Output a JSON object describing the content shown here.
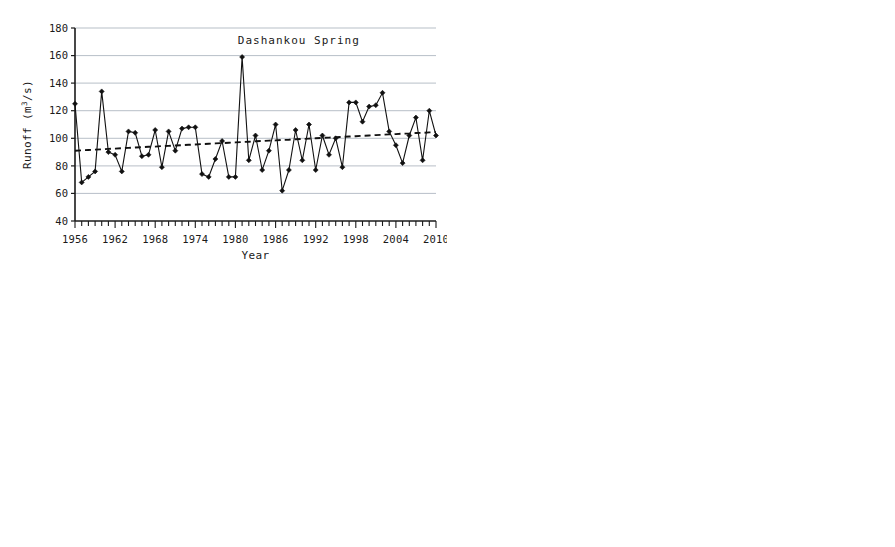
{
  "figure": {
    "station": "Dashankou",
    "x_axis_label": "Year",
    "y_axis_label_main": "Runoff",
    "y_axis_label_units": "(m/s)",
    "y_axis_units_superscript": "3"
  },
  "chart_data": [
    {
      "type": "line",
      "title": "Dashankou    Spring",
      "station": "Dashankou",
      "season": "Spring",
      "xlabel": "Year",
      "ylabel": "Runoff (m3/s)",
      "xlim": [
        1956,
        2010
      ],
      "ylim": [
        40,
        180
      ],
      "ytick_values": [
        40,
        60,
        80,
        100,
        120,
        140,
        160,
        180
      ],
      "xtick_labels": [
        1956,
        1962,
        1968,
        1974,
        1980,
        1986,
        1992,
        1998,
        2004,
        2010
      ],
      "grid": true,
      "legend": "none",
      "x": [
        1956,
        1957,
        1958,
        1959,
        1960,
        1961,
        1962,
        1963,
        1964,
        1965,
        1966,
        1967,
        1968,
        1969,
        1970,
        1971,
        1972,
        1973,
        1974,
        1975,
        1976,
        1977,
        1978,
        1979,
        1980,
        1981,
        1982,
        1983,
        1984,
        1985,
        1986,
        1987,
        1988,
        1989,
        1990,
        1991,
        1992,
        1993,
        1994,
        1995,
        1996,
        1997,
        1998,
        1999,
        2000,
        2001,
        2002,
        2003,
        2004,
        2005,
        2006,
        2007,
        2008,
        2009,
        2010
      ],
      "series": [
        {
          "name": "Spring runoff",
          "marker": "diamond",
          "style": "solid",
          "values": [
            125,
            68,
            72,
            76,
            134,
            90,
            88,
            76,
            105,
            104,
            87,
            88,
            106,
            79,
            105,
            91,
            107,
            108,
            108,
            74,
            72,
            85,
            98,
            72,
            72,
            159,
            84,
            102,
            77,
            91,
            110,
            62,
            77,
            106,
            84,
            110,
            77,
            102,
            88,
            100,
            79,
            126,
            126,
            112,
            123,
            124,
            133,
            105,
            95,
            82,
            102,
            115,
            84,
            120,
            102
          ]
        },
        {
          "name": "Trend line",
          "marker": "none",
          "style": "dashed",
          "values": [
            91,
            91.3,
            91.5,
            91.8,
            92,
            92.3,
            92.5,
            92.8,
            93,
            93.3,
            93.5,
            93.8,
            94,
            94.3,
            94.5,
            94.8,
            95,
            95.3,
            95.5,
            95.8,
            96,
            96.3,
            96.5,
            96.8,
            97,
            97.3,
            97.5,
            97.8,
            98,
            98.3,
            98.5,
            98.8,
            99,
            99.3,
            99.5,
            99.8,
            100,
            100.3,
            100.5,
            100.8,
            101,
            101.3,
            101.5,
            101.8,
            102,
            102.3,
            102.5,
            102.8,
            103,
            103.3,
            103.5,
            103.8,
            104,
            104.3,
            104.5
          ]
        }
      ]
    },
    {
      "type": "line",
      "title": "Dashankou    Summer",
      "station": "Dashankou",
      "season": "Summer",
      "xlabel": "Year",
      "ylabel": "Runoff (m3/s)",
      "xlim": [
        1956,
        2010
      ],
      "ylim": [
        40,
        440
      ],
      "ytick_values": [
        40,
        90,
        140,
        190,
        240,
        290,
        340,
        390,
        440
      ],
      "xtick_labels": [
        1956,
        1962,
        1968,
        1974,
        1980,
        1986,
        1992,
        1998,
        2004,
        2010
      ],
      "grid": true,
      "legend": "none",
      "x": [
        1956,
        1957,
        1958,
        1959,
        1960,
        1961,
        1962,
        1963,
        1964,
        1965,
        1966,
        1967,
        1968,
        1969,
        1970,
        1971,
        1972,
        1973,
        1974,
        1975,
        1976,
        1977,
        1978,
        1979,
        1980,
        1981,
        1982,
        1983,
        1984,
        1985,
        1986,
        1987,
        1988,
        1989,
        1990,
        1991,
        1992,
        1993,
        1994,
        1995,
        1996,
        1997,
        1998,
        1999,
        2000,
        2001,
        2002,
        2003,
        2004,
        2005,
        2006,
        2007,
        2008,
        2009,
        2010
      ],
      "series": [
        {
          "name": "Summer runoff",
          "marker": "diamond",
          "style": "solid",
          "values": [
            234,
            180,
            301,
            255,
            192,
            165,
            166,
            215,
            219,
            185,
            187,
            125,
            228,
            238,
            256,
            194,
            191,
            115,
            196,
            138,
            196,
            172,
            186,
            187,
            152,
            163,
            178,
            149,
            147,
            147,
            139,
            232,
            166,
            165,
            145,
            190,
            203,
            205,
            181,
            241,
            140,
            205,
            231,
            310,
            305,
            225,
            208,
            385,
            207,
            182,
            178,
            180,
            215,
            213,
            194,
            283
          ]
        },
        {
          "name": "Trend line",
          "marker": "none",
          "style": "dashed",
          "values": [
            188,
            188.6,
            189.1,
            189.7,
            190.3,
            190.9,
            191.4,
            192,
            192.6,
            193.1,
            193.7,
            194.3,
            194.9,
            195.4,
            196,
            196.6,
            197.1,
            197.7,
            198.3,
            198.9,
            199.4,
            200,
            200.6,
            201.1,
            201.7,
            202.3,
            202.9,
            203.4,
            204,
            204.6,
            205.1,
            205.7,
            206.3,
            206.9,
            207.4,
            208,
            208.6,
            209.1,
            209.7,
            210.3,
            210.9,
            211.4,
            212,
            212.6,
            213.1,
            213.7,
            214.3,
            214.9,
            215.4,
            216,
            216.6,
            217.1,
            217.7,
            218.3,
            218.9
          ]
        }
      ]
    },
    {
      "type": "line",
      "title": "Dashankou    Autumn",
      "station": "Dashankou",
      "season": "Autumn",
      "xlabel": "Year",
      "ylabel": "Runoff (m3/s)",
      "xlim": [
        1956,
        2010
      ],
      "ylim": [
        40,
        340
      ],
      "ytick_values": [
        40,
        90,
        140,
        190,
        240,
        290,
        340
      ],
      "xtick_labels": [
        1956,
        1962,
        1968,
        1974,
        1980,
        1986,
        1992,
        1998,
        2004,
        2010
      ],
      "grid": true,
      "legend": "none",
      "x": [
        1956,
        1957,
        1958,
        1959,
        1960,
        1961,
        1962,
        1963,
        1964,
        1965,
        1966,
        1967,
        1968,
        1969,
        1970,
        1971,
        1972,
        1973,
        1974,
        1975,
        1976,
        1977,
        1978,
        1979,
        1980,
        1981,
        1982,
        1983,
        1984,
        1985,
        1986,
        1987,
        1988,
        1989,
        1990,
        1991,
        1992,
        1993,
        1994,
        1995,
        1996,
        1997,
        1998,
        1999,
        2000,
        2001,
        2002,
        2003,
        2004,
        2005,
        2006,
        2007,
        2008,
        2009,
        2010
      ],
      "series": [
        {
          "name": "Autumn runoff",
          "marker": "diamond",
          "style": "solid",
          "values": [
            94,
            83,
            137,
            108,
            97,
            92,
            91,
            95,
            102,
            104,
            95,
            98,
            96,
            82,
            94,
            157,
            112,
            97,
            85,
            81,
            80,
            83,
            83,
            82,
            90,
            74,
            67,
            65,
            65,
            66,
            69,
            80,
            131,
            75,
            86,
            78,
            93,
            97,
            113,
            92,
            101,
            106,
            118,
            125,
            122,
            136,
            126,
            83,
            81,
            128,
            277,
            114,
            117,
            105,
            270
          ]
        },
        {
          "name": "Trend line",
          "marker": "none",
          "style": "dashed",
          "values": [
            83,
            83.7,
            84.4,
            85.1,
            85.8,
            86.5,
            87.2,
            87.9,
            88.6,
            89.3,
            90,
            90.7,
            91.4,
            92.1,
            92.8,
            93.5,
            94.2,
            94.9,
            95.6,
            96.3,
            97,
            97.7,
            98.4,
            99.1,
            99.8,
            100.5,
            101.2,
            101.9,
            102.6,
            103.3,
            104,
            104.7,
            105.4,
            106.1,
            106.8,
            107.5,
            108.2,
            108.9,
            109.6,
            110.3,
            111,
            111.7,
            112.4,
            113.1,
            113.8,
            114.5,
            115.2,
            115.9,
            116.6,
            117.3,
            118,
            118.7,
            119.4,
            120.1,
            120.8
          ]
        }
      ]
    },
    {
      "type": "line",
      "title": "Dashankou    Winter",
      "station": "Dashankou",
      "season": "Winter",
      "xlabel": "Year",
      "ylabel": "Runoff (m3/s)",
      "xlim": [
        1956,
        2010
      ],
      "ylim": [
        0,
        180
      ],
      "ytick_values": [
        0,
        20,
        40,
        60,
        80,
        100,
        120,
        140,
        160,
        180
      ],
      "xtick_labels": [
        1956,
        1962,
        1968,
        1974,
        1980,
        1986,
        1992,
        1998,
        2004,
        2010
      ],
      "grid": true,
      "legend": "none",
      "x": [
        1956,
        1957,
        1958,
        1959,
        1960,
        1961,
        1962,
        1963,
        1964,
        1965,
        1966,
        1967,
        1968,
        1969,
        1970,
        1971,
        1972,
        1973,
        1974,
        1975,
        1976,
        1977,
        1978,
        1979,
        1980,
        1981,
        1982,
        1983,
        1984,
        1985,
        1986,
        1987,
        1988,
        1989,
        1990,
        1991,
        1992,
        1993,
        1994,
        1995,
        1996,
        1997,
        1998,
        1999,
        2000,
        2001,
        2002,
        2003,
        2004,
        2005,
        2006,
        2007,
        2008,
        2009,
        2010
      ],
      "series": [
        {
          "name": "Winter runoff",
          "marker": "diamond",
          "style": "solid",
          "values": [
            39,
            33,
            43,
            58,
            61,
            55,
            48,
            44,
            43,
            43,
            45,
            47,
            41,
            40,
            40,
            44,
            51,
            55,
            49,
            45,
            37,
            41,
            41,
            42,
            41,
            43,
            44,
            43,
            44,
            43,
            38,
            39,
            40,
            42,
            42,
            42,
            41,
            45,
            50,
            54,
            58,
            61,
            65,
            66,
            64,
            66,
            74,
            69,
            74,
            67,
            53,
            168,
            53,
            50,
            60,
            122
          ]
        },
        {
          "name": "Trend line",
          "marker": "none",
          "style": "dashed",
          "values": [
            35,
            35.6,
            36.2,
            36.8,
            37.4,
            38,
            38.6,
            39.2,
            39.8,
            40.4,
            41,
            41.6,
            42.2,
            42.8,
            43.4,
            44,
            44.6,
            45.2,
            45.8,
            46.4,
            47,
            47.6,
            48.2,
            48.8,
            49.4,
            50,
            50.6,
            51.2,
            51.8,
            52.4,
            53,
            53.6,
            54.2,
            54.8,
            55.4,
            56,
            56.6,
            57.2,
            57.8,
            58.4,
            59,
            59.6,
            60.2,
            60.8,
            61.4,
            62,
            62.6,
            63.2,
            63.8,
            64.4,
            65,
            65.6,
            66.2,
            66.8,
            67.4
          ]
        }
      ]
    }
  ]
}
